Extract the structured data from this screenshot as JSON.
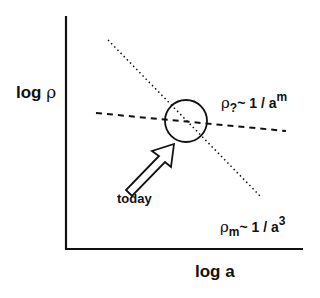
{
  "diagram": {
    "y_axis_label": {
      "prefix": "log ",
      "symbol": "ρ"
    },
    "x_axis_label": "log a",
    "pointer_label": "today",
    "curves": [
      {
        "name": "unknown-component",
        "style": "dashed",
        "symbol": "ρ",
        "subscript": "?",
        "relation": "~ 1 / a",
        "exponent": "m"
      },
      {
        "name": "matter",
        "style": "dotted",
        "symbol": "ρ",
        "subscript": "m",
        "relation": "~ 1 / a",
        "exponent": "3"
      }
    ],
    "marker": "circle at intersection",
    "colors": {
      "ink": "#111111",
      "background": "#ffffff"
    }
  }
}
